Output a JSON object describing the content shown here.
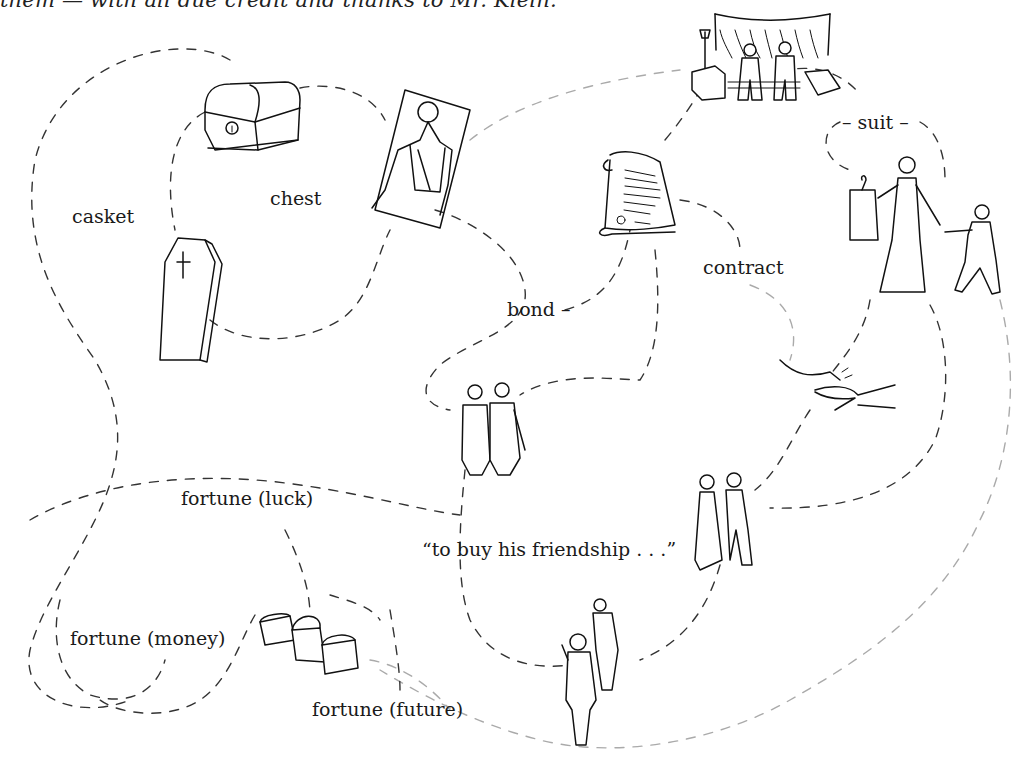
{
  "caption": "them — with all due credit and thanks to Mr. Klein.",
  "labels": {
    "casket": "casket",
    "chest": "chest",
    "bond": "bond –",
    "contract": "contract",
    "suit": "– suit –",
    "fortune_luck": "fortune (luck)",
    "quote": "“to buy his friendship . . .”",
    "fortune_money": "fortune (money)",
    "fortune_future": "fortune (future)"
  },
  "illustrations": [
    {
      "name": "treasure-chest",
      "label": "chest"
    },
    {
      "name": "coffin",
      "label": "casket"
    },
    {
      "name": "man-lying-in-casket",
      "label": "chest"
    },
    {
      "name": "courtroom-crowd",
      "label": "suit"
    },
    {
      "name": "scroll-document",
      "label": "contract"
    },
    {
      "name": "woman-with-suit-and-proposal",
      "label": "suit"
    },
    {
      "name": "two-men-friends",
      "label": "bond"
    },
    {
      "name": "handshake-money",
      "label": "contract"
    },
    {
      "name": "couple",
      "label": "friendship"
    },
    {
      "name": "two-people-walking",
      "label": "friendship"
    },
    {
      "name": "three-treasure-chests",
      "label": "fortune"
    }
  ]
}
